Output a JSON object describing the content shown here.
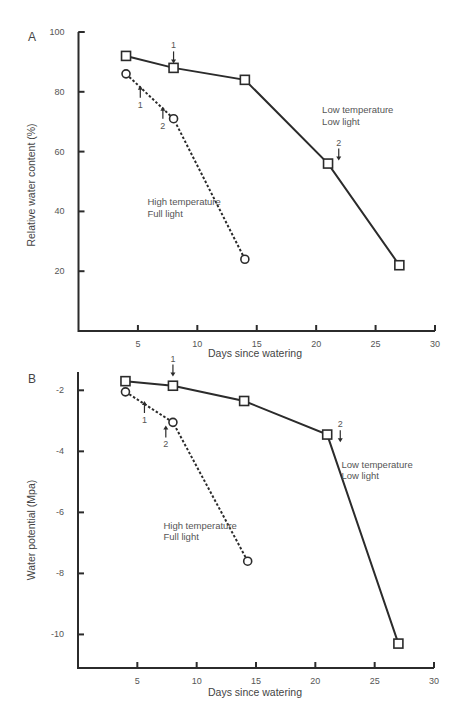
{
  "chart_data": [
    {
      "panel": "A",
      "type": "line",
      "title": "",
      "xlabel": "Days since watering",
      "ylabel": "Relative water content (%)",
      "xlim": [
        0,
        30
      ],
      "ylim": [
        0,
        100
      ],
      "x_ticks": [
        5,
        10,
        15,
        20,
        25,
        30
      ],
      "y_ticks": [
        20,
        40,
        60,
        80,
        100
      ],
      "grid": false,
      "series": [
        {
          "name": "Low temperature, Low light",
          "marker": "square",
          "line": "solid",
          "x": [
            4,
            8,
            14,
            21,
            27
          ],
          "y": [
            92,
            88,
            84,
            56,
            22
          ]
        },
        {
          "name": "High temperature, Full light",
          "marker": "circle",
          "line": "dashed",
          "x": [
            4,
            8,
            14
          ],
          "y": [
            86,
            71,
            24
          ]
        }
      ],
      "annotations": [
        {
          "text": "Low temperature",
          "x": 20.5,
          "y": 73
        },
        {
          "text": "Low light",
          "x": 20.5,
          "y": 69
        },
        {
          "text": "High temperature",
          "x": 5.8,
          "y": 42
        },
        {
          "text": "Full light",
          "x": 5.8,
          "y": 38
        }
      ],
      "arrows": [
        {
          "label": "1",
          "x": 8,
          "y": 89.5,
          "dir": "down"
        },
        {
          "label": "2",
          "x": 21.9,
          "y": 57,
          "dir": "down"
        },
        {
          "label": "1",
          "x": 5.2,
          "y": 82,
          "dir": "up"
        },
        {
          "label": "2",
          "x": 7.1,
          "y": 75,
          "dir": "up"
        }
      ]
    },
    {
      "panel": "B",
      "type": "line",
      "title": "",
      "xlabel": "Days since watering",
      "ylabel": "Water potential (Mpa)",
      "xlim": [
        0,
        30
      ],
      "ylim": [
        -11.1,
        -1.4
      ],
      "x_ticks": [
        5,
        10,
        15,
        20,
        25,
        30
      ],
      "y_ticks": [
        -2,
        -4,
        -6,
        -8,
        -10
      ],
      "grid": false,
      "series": [
        {
          "name": "Low temperature, Low light",
          "marker": "square",
          "line": "solid",
          "x": [
            4,
            8,
            14,
            21,
            27
          ],
          "y": [
            -1.7,
            -1.85,
            -2.35,
            -3.45,
            -10.3
          ]
        },
        {
          "name": "High temperature, Full light",
          "marker": "circle",
          "line": "dashed",
          "x": [
            4,
            8,
            14.3
          ],
          "y": [
            -2.05,
            -3.05,
            -7.6
          ]
        }
      ],
      "annotations": [
        {
          "text": "Low temperature",
          "x": 22.2,
          "y": -4.55
        },
        {
          "text": "Low light",
          "x": 22.2,
          "y": -4.9
        },
        {
          "text": "High temperature",
          "x": 7.2,
          "y": -6.55
        },
        {
          "text": "Full light",
          "x": 7.2,
          "y": -6.9
        }
      ],
      "arrows": [
        {
          "label": "1",
          "x": 8,
          "y": -1.55,
          "dir": "down"
        },
        {
          "label": "2",
          "x": 22.1,
          "y": -3.7,
          "dir": "down"
        },
        {
          "label": "1",
          "x": 5.6,
          "y": -2.35,
          "dir": "up"
        },
        {
          "label": "2",
          "x": 7.4,
          "y": -3.15,
          "dir": "up"
        }
      ]
    }
  ],
  "panels": {
    "A": {
      "label": "A",
      "xlabel": "Days since watering",
      "ylabel": "Relative water content (%)"
    },
    "B": {
      "label": "B",
      "xlabel": "Days since watering",
      "ylabel": "Water potential (Mpa)"
    }
  },
  "style": {
    "ink": "#2b2b2b",
    "text": "#555555",
    "background": "#ffffff"
  }
}
